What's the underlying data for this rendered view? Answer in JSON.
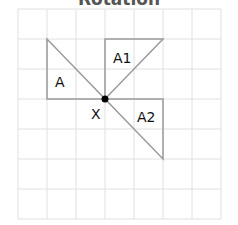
{
  "title": "Rotation",
  "grid": {
    "cols": 7,
    "rows": 7,
    "color": "#dddddd"
  },
  "shapes": [
    {
      "name": "A",
      "label": "A"
    },
    {
      "name": "A1",
      "label": "A1"
    },
    {
      "name": "A2",
      "label": "A2"
    }
  ],
  "center_point": {
    "label": "X"
  },
  "colors": {
    "shape_stroke": "#999999",
    "point": "#000000"
  }
}
